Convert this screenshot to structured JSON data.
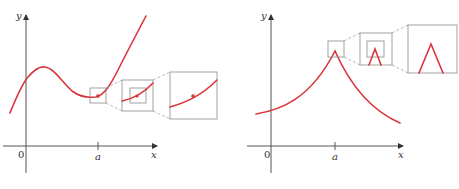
{
  "figures": [
    {
      "id": "smooth-curve-zoom",
      "description": "A differentiable function: zooming in on point a makes the curve look like a straight line",
      "axis_labels": {
        "x": "x",
        "y": "y",
        "origin": "0",
        "tick": "a"
      },
      "colors": {
        "curve": "#d9343a",
        "axes": "#555555",
        "boxes": "#8a8a8a"
      },
      "zoom_levels": 3
    },
    {
      "id": "corner-curve-zoom",
      "description": "A function with a corner at a: zooming in keeps showing the sharp corner",
      "axis_labels": {
        "x": "x",
        "y": "y",
        "origin": "0",
        "tick": "a"
      },
      "colors": {
        "curve": "#d9343a",
        "axes": "#555555",
        "boxes": "#8a8a8a"
      },
      "zoom_levels": 3
    }
  ]
}
